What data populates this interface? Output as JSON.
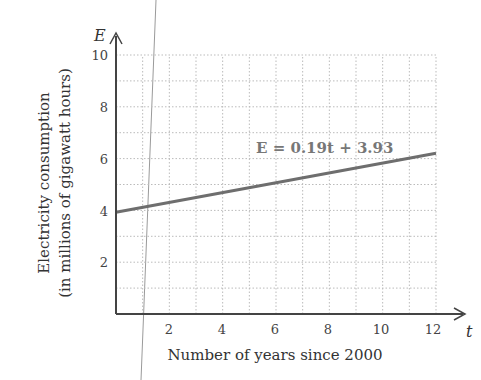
{
  "chart_data": {
    "type": "line",
    "title": "",
    "xlabel": "Number of years since 2000",
    "ylabel_line1": "Electricity consumption",
    "ylabel_line2": "(in millions of gigawatt hours)",
    "x_var": "t",
    "y_var": "E",
    "xlim": [
      0,
      12
    ],
    "ylim": [
      0,
      10
    ],
    "x_ticks": [
      "2",
      "4",
      "6",
      "8",
      "10",
      "12"
    ],
    "y_ticks": [
      "2",
      "4",
      "6",
      "8",
      "10"
    ],
    "grid": true,
    "grid_step": 1,
    "series": [
      {
        "name": "E = 0.19t + 3.93",
        "equation": "E = 0.19t + 3.93",
        "slope": 0.19,
        "intercept": 3.93,
        "x": [
          0,
          12
        ],
        "values": [
          3.93,
          6.21
        ]
      }
    ],
    "annotations": [
      "E = 0.19t + 3.93"
    ],
    "legend": "none"
  },
  "colors": {
    "line": "#6e6e6e",
    "axis": "#444444",
    "grid": "#bbbbbb",
    "equation": "#777777"
  }
}
